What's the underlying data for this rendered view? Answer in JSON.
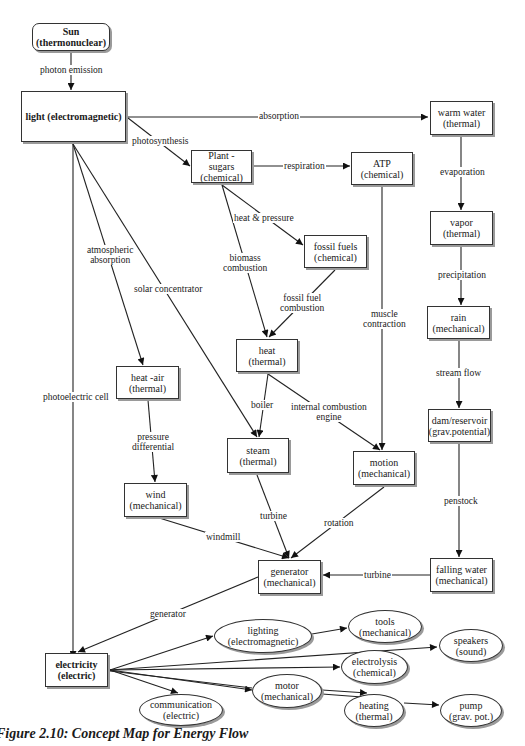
{
  "diagram": {
    "nodes": [
      {
        "id": "sun",
        "label": "Sun\n(thermonuclear)",
        "shape": "rounded",
        "bold": true
      },
      {
        "id": "light",
        "label": "light (electromagnetic)",
        "shape": "rect",
        "bold": true
      },
      {
        "id": "plant_sugars",
        "label": "Plant -\nsugars\n(chemical)",
        "shape": "rect"
      },
      {
        "id": "atp",
        "label": "ATP\n(chemical)",
        "shape": "rect"
      },
      {
        "id": "warm_water",
        "label": "warm water\n(thermal)",
        "shape": "rect"
      },
      {
        "id": "fossil_fuels",
        "label": "fossil fuels\n(chemical)",
        "shape": "rect"
      },
      {
        "id": "vapor",
        "label": "vapor\n(thermal)",
        "shape": "rect"
      },
      {
        "id": "heat",
        "label": "heat\n(thermal)",
        "shape": "rect"
      },
      {
        "id": "rain",
        "label": "rain\n(mechanical)",
        "shape": "rect"
      },
      {
        "id": "heat_air",
        "label": "heat -air\n(thermal)",
        "shape": "rect"
      },
      {
        "id": "steam",
        "label": "steam\n(thermal)",
        "shape": "rect"
      },
      {
        "id": "motion",
        "label": "motion\n(mechanical)",
        "shape": "rect"
      },
      {
        "id": "dam_reservoir",
        "label": "dam/reservoir\n(grav.potential)",
        "shape": "rect"
      },
      {
        "id": "wind",
        "label": "wind\n(mechanical)",
        "shape": "rect"
      },
      {
        "id": "generator",
        "label": "generator\n(mechanical)",
        "shape": "rect"
      },
      {
        "id": "falling_water",
        "label": "falling water\n(mechanical)",
        "shape": "rect"
      },
      {
        "id": "electricity",
        "label": "electricity\n(electric)",
        "shape": "rect",
        "bold": true
      },
      {
        "id": "lighting",
        "label": "lighting\n(electromagnetic)",
        "shape": "ellipse"
      },
      {
        "id": "tools",
        "label": "tools\n(mechanical)",
        "shape": "ellipse"
      },
      {
        "id": "speakers",
        "label": "speakers\n(sound)",
        "shape": "ellipse"
      },
      {
        "id": "electrolysis",
        "label": "electrolysis\n(chemical)",
        "shape": "ellipse"
      },
      {
        "id": "motor",
        "label": "motor\n(mechanical)",
        "shape": "ellipse"
      },
      {
        "id": "heating",
        "label": "heating\n(thermal)",
        "shape": "ellipse"
      },
      {
        "id": "pump",
        "label": "pump\n(grav. pot.)",
        "shape": "ellipse"
      },
      {
        "id": "communication",
        "label": "communication\n(electric)",
        "shape": "ellipse"
      }
    ],
    "edges": [
      {
        "from": "sun",
        "to": "light",
        "label": "photon emission"
      },
      {
        "from": "light",
        "to": "warm_water",
        "label": "absorption"
      },
      {
        "from": "light",
        "to": "plant_sugars",
        "label": "photosynthesis"
      },
      {
        "from": "plant_sugars",
        "to": "atp",
        "label": "respiration"
      },
      {
        "from": "plant_sugars",
        "to": "fossil_fuels",
        "label": "heat & pressure"
      },
      {
        "from": "plant_sugars",
        "to": "heat",
        "label": "biomass\ncombustion"
      },
      {
        "from": "fossil_fuels",
        "to": "heat",
        "label": "fossil fuel\ncombustion"
      },
      {
        "from": "warm_water",
        "to": "vapor",
        "label": "evaporation"
      },
      {
        "from": "vapor",
        "to": "rain",
        "label": "precipitation"
      },
      {
        "from": "rain",
        "to": "dam_reservoir",
        "label": "stream flow"
      },
      {
        "from": "dam_reservoir",
        "to": "falling_water",
        "label": "penstock"
      },
      {
        "from": "falling_water",
        "to": "generator",
        "label": "turbine"
      },
      {
        "from": "atp",
        "to": "motion",
        "label": "muscle\ncontraction"
      },
      {
        "from": "light",
        "to": "heat_air",
        "label": "atmospheric\nabsorption"
      },
      {
        "from": "light",
        "to": "steam",
        "label": "solar concentrator"
      },
      {
        "from": "light",
        "to": "electricity",
        "label": "photoelectric cell"
      },
      {
        "from": "heat",
        "to": "steam",
        "label": "boiler"
      },
      {
        "from": "heat",
        "to": "motion",
        "label": "internal combustion\nengine"
      },
      {
        "from": "heat_air",
        "to": "wind",
        "label": "pressure\ndifferential"
      },
      {
        "from": "wind",
        "to": "generator",
        "label": "windmill"
      },
      {
        "from": "steam",
        "to": "generator",
        "label": "turbine"
      },
      {
        "from": "motion",
        "to": "generator",
        "label": "rotation"
      },
      {
        "from": "generator",
        "to": "electricity",
        "label": "generator"
      },
      {
        "from": "electricity",
        "to": "lighting",
        "label": ""
      },
      {
        "from": "lighting",
        "to": "tools",
        "label": ""
      },
      {
        "from": "electricity",
        "to": "speakers",
        "label": ""
      },
      {
        "from": "electricity",
        "to": "electrolysis",
        "label": ""
      },
      {
        "from": "electricity",
        "to": "motor",
        "label": ""
      },
      {
        "from": "motor",
        "to": "heating",
        "label": ""
      },
      {
        "from": "electricity",
        "to": "heating",
        "label": ""
      },
      {
        "from": "heating",
        "to": "pump",
        "label": ""
      },
      {
        "from": "electricity",
        "to": "communication",
        "label": ""
      }
    ]
  },
  "caption": {
    "number": "Figure 2.10",
    "title": "Concept Map for Energy Flow"
  }
}
